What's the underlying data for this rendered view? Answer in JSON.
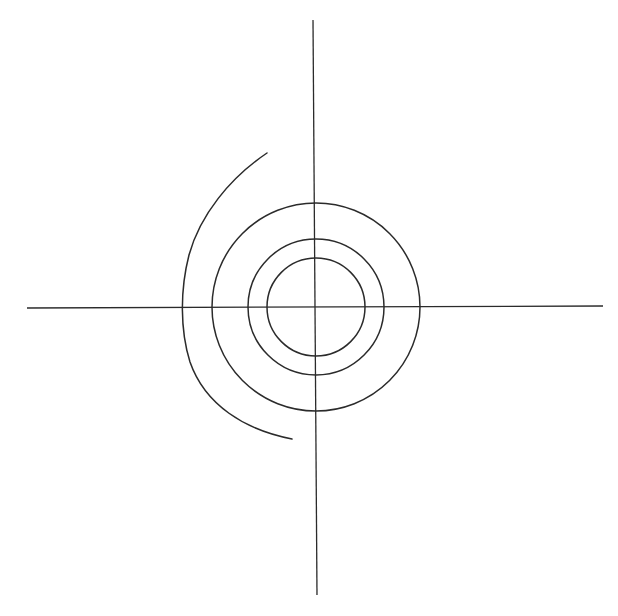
{
  "diagram": {
    "type": "concentric-circles-with-axes",
    "background": "#ffffff",
    "stroke_color": "#2b2b2b",
    "center": {
      "x": 316,
      "y": 307
    },
    "axes": {
      "horizontal": {
        "x1": 27,
        "y1": 308,
        "x2": 603,
        "y2": 306
      },
      "vertical": {
        "x1": 313,
        "y1": 20,
        "x2": 317,
        "y2": 595
      }
    },
    "circles": [
      {
        "name": "inner-circle",
        "r": 49
      },
      {
        "name": "middle-circle",
        "r": 68
      },
      {
        "name": "outer-circle",
        "r": 104
      }
    ],
    "open_arc": {
      "name": "left-open-arc",
      "start": {
        "x": 267,
        "y": 153
      },
      "end": {
        "x": 292,
        "y": 439
      },
      "path": "M267,153 C230,178 200,215 189,255 C180,290 180,330 190,362 C205,405 245,430 292,439"
    }
  }
}
